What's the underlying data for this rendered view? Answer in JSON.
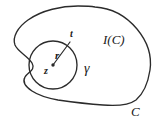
{
  "figure": {
    "kind": "contour-integral-diagram",
    "width": 167,
    "height": 127,
    "background_color": "#ffffff",
    "stroke_color": "#2b2b2b",
    "labels": {
      "outer_contour": "C",
      "interior_region": "I(C)",
      "inner_circle": "γ",
      "center_point": "z",
      "radius": "r",
      "boundary_point": "t"
    },
    "geometry": {
      "inner_circle": {
        "center_x": 53,
        "center_y": 65,
        "radius": 24
      },
      "radius_line": {
        "from_x": 53,
        "from_y": 65,
        "to_x": 70,
        "to_y": 41
      },
      "center_dot_radius": 1.6
    }
  }
}
